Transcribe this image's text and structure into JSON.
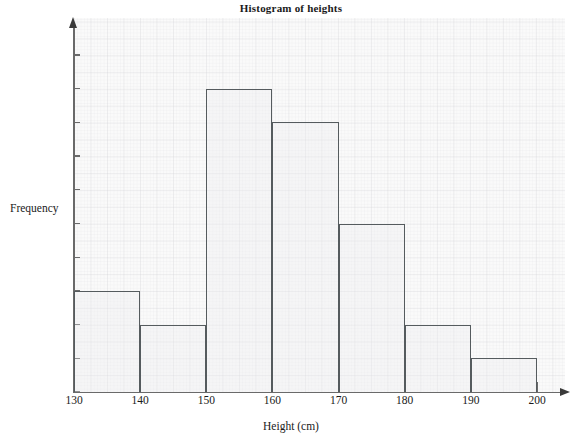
{
  "chart_data": {
    "type": "bar",
    "title": "Histogram of heights",
    "xlabel": "Height (cm)",
    "ylabel": "Frequency",
    "categories": [
      "130-140",
      "140-150",
      "150-160",
      "160-170",
      "170-180",
      "180-190",
      "190-200"
    ],
    "bin_edges": [
      130,
      140,
      150,
      160,
      170,
      180,
      190,
      200
    ],
    "values": [
      3,
      2,
      9,
      8,
      5,
      2,
      1
    ],
    "xlim": [
      130,
      200
    ],
    "ylim": [
      0,
      10
    ],
    "x_ticks": [
      "130",
      "140",
      "150",
      "160",
      "170",
      "180",
      "190",
      "200"
    ],
    "y_ticks": [
      "0",
      "1",
      "2",
      "3",
      "4",
      "5",
      "6",
      "7",
      "8",
      "9",
      "10"
    ],
    "grid": true,
    "grid_style": "graph-paper",
    "legend": null,
    "bar_edge_color": "#555b5e",
    "bar_fill_color": "#f2f2f3",
    "axis_color": "#6a6a6a",
    "background_color": "#ffffff"
  }
}
